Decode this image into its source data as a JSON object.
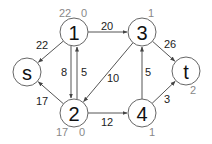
{
  "nodes": [
    {
      "id": "1",
      "label": "1",
      "x": 74,
      "y": 32,
      "r": 14,
      "annot": [
        {
          "text": "22",
          "x": 65,
          "y": 13
        },
        {
          "text": "0",
          "x": 84,
          "y": 13
        }
      ]
    },
    {
      "id": "3",
      "label": "3",
      "x": 142,
      "y": 32,
      "r": 14,
      "annot": [
        {
          "text": "1",
          "x": 151,
          "y": 13
        }
      ]
    },
    {
      "id": "s",
      "label": "s",
      "x": 27,
      "y": 72,
      "r": 14,
      "annot": []
    },
    {
      "id": "t",
      "label": "t",
      "x": 186,
      "y": 71,
      "r": 14,
      "annot": [
        {
          "text": "2",
          "x": 193,
          "y": 90
        }
      ]
    },
    {
      "id": "2",
      "label": "2",
      "x": 74,
      "y": 113,
      "r": 14,
      "annot": [
        {
          "text": "17",
          "x": 62,
          "y": 132
        },
        {
          "text": "0",
          "x": 82,
          "y": 132
        }
      ]
    },
    {
      "id": "4",
      "label": "4",
      "x": 142,
      "y": 113,
      "r": 14,
      "annot": [
        {
          "text": "1",
          "x": 152,
          "y": 132
        }
      ]
    }
  ],
  "edges": [
    {
      "from": "1",
      "to": "3",
      "label": "20",
      "lx": 107,
      "ly": 26
    },
    {
      "from": "1",
      "to": "s",
      "label": "22",
      "lx": 42,
      "ly": 45
    },
    {
      "from": "1",
      "to": "2",
      "label": "8",
      "lx": 64,
      "ly": 72,
      "offset": -3
    },
    {
      "from": "2",
      "to": "1",
      "label": "5",
      "lx": 84,
      "ly": 72,
      "offset": 3
    },
    {
      "from": "2",
      "to": "s",
      "label": "17",
      "lx": 42,
      "ly": 101
    },
    {
      "from": "3",
      "to": "2",
      "label": "10",
      "lx": 113,
      "ly": 78
    },
    {
      "from": "4",
      "to": "3",
      "label": "5",
      "lx": 148,
      "ly": 72
    },
    {
      "from": "3",
      "to": "t",
      "label": "26",
      "lx": 170,
      "ly": 44
    },
    {
      "from": "2",
      "to": "4",
      "label": "12",
      "lx": 107,
      "ly": 122
    },
    {
      "from": "4",
      "to": "t",
      "label": "3",
      "lx": 167,
      "ly": 99
    }
  ]
}
